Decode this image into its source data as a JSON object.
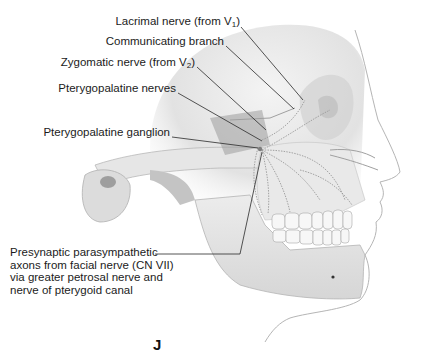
{
  "figure": {
    "panel_letter": "J"
  },
  "labels": [
    {
      "id": "lacrimal",
      "text": "Lacrimal nerve (from V",
      "sub": "1",
      "tail": ")"
    },
    {
      "id": "communicating",
      "text": "Communicating branch",
      "sub": "",
      "tail": ""
    },
    {
      "id": "zygomatic",
      "text": "Zygomatic nerve (from V",
      "sub": "2",
      "tail": ")"
    },
    {
      "id": "pterygopalatine-nerves",
      "text": "Pterygopalatine nerves",
      "sub": "",
      "tail": ""
    },
    {
      "id": "pterygopalatine-ganglion",
      "text": "Pterygopalatine ganglion",
      "sub": "",
      "tail": ""
    }
  ],
  "presynaptic": {
    "lines": [
      "Presynaptic parasympathetic",
      "axons from facial nerve (CN VII)",
      "via greater petrosal nerve and",
      "nerve of pterygoid canal"
    ]
  },
  "colors": {
    "bone": "#e8e8e8",
    "bone_shadow": "#bdbdbd",
    "nerve": "#9a9a9a",
    "leader_line": "#2a2a2a",
    "text": "#1b1b1b"
  }
}
